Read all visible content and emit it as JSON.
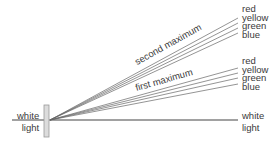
{
  "diagram": {
    "incident": {
      "line1": "white",
      "line2": "light"
    },
    "central": {
      "line1": "white",
      "line2": "light"
    },
    "first_order": {
      "label": "first maximum",
      "colors": [
        "red",
        "yellow",
        "green",
        "blue"
      ]
    },
    "second_order": {
      "label": "second maximum",
      "colors": [
        "red",
        "yellow",
        "green",
        "blue"
      ]
    },
    "line_color": "#555555",
    "grating_color": "#cccccc"
  }
}
